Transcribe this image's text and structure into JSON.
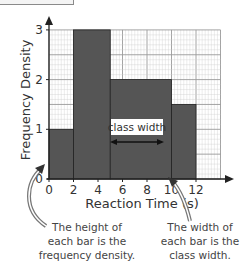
{
  "chart_data": {
    "type": "bar",
    "subtype": "histogram",
    "title": "",
    "xlabel": "Reaction Time (s)",
    "ylabel": "Frequency Density",
    "bins": [
      {
        "from": 0,
        "to": 2,
        "value": 1
      },
      {
        "from": 2,
        "to": 5,
        "value": 3
      },
      {
        "from": 5,
        "to": 10,
        "value": 2
      },
      {
        "from": 10,
        "to": 12,
        "value": 1.5
      }
    ],
    "categories": [
      "0-2",
      "2-5",
      "5-10",
      "10-12"
    ],
    "values": [
      1,
      3,
      2,
      1.5
    ],
    "x_ticks": [
      "0",
      "2",
      "4",
      "6",
      "8",
      "10",
      "12"
    ],
    "y_ticks": [
      "0",
      "1",
      "2",
      "3"
    ],
    "xlim": [
      0,
      14
    ],
    "ylim": [
      0,
      3
    ],
    "grid": true,
    "legend": null,
    "annotations": [
      {
        "id": "class_width",
        "text": "class width"
      },
      {
        "id": "height_note",
        "text_lines": [
          "The height of",
          "each bar is the",
          "frequency density."
        ]
      },
      {
        "id": "width_note",
        "text_lines": [
          "The width of",
          "each bar is the",
          "class width."
        ]
      }
    ],
    "colors": {
      "bar": "#555555",
      "grid_minor": "#cfcfcf",
      "grid_major": "#9a9a9a",
      "arrow": "#888888"
    }
  }
}
